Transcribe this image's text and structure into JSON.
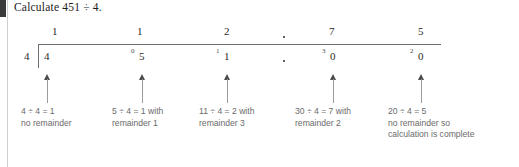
{
  "title": "Calculate 451 ÷ 4.",
  "marker": {
    "color": "#3a3a3a"
  },
  "division": {
    "divisor": "4",
    "quotient_digits": [
      "1",
      "1",
      "2",
      "7",
      "5"
    ],
    "quotient_decimal_point": true,
    "dividend_digits": [
      "4",
      "5",
      "1",
      "0",
      "0"
    ],
    "dividend_decimal_point": true,
    "carries": [
      "",
      "0",
      "1",
      "3",
      "2"
    ],
    "quotient_text": "112.75",
    "dividend_text": "451.00"
  },
  "steps": [
    {
      "lines": [
        "4 ÷ 4 = 1",
        "no remainder"
      ]
    },
    {
      "lines": [
        "5 ÷ 4 = 1 with",
        "remainder 1"
      ]
    },
    {
      "lines": [
        "11 ÷ 4 = 2 with",
        "remainder 3"
      ]
    },
    {
      "lines": [
        "30 ÷ 4 = 7 with",
        "remainder 2"
      ]
    },
    {
      "lines": [
        "20 ÷ 4 = 5",
        "no remainder so",
        "calculation is complete"
      ]
    }
  ]
}
